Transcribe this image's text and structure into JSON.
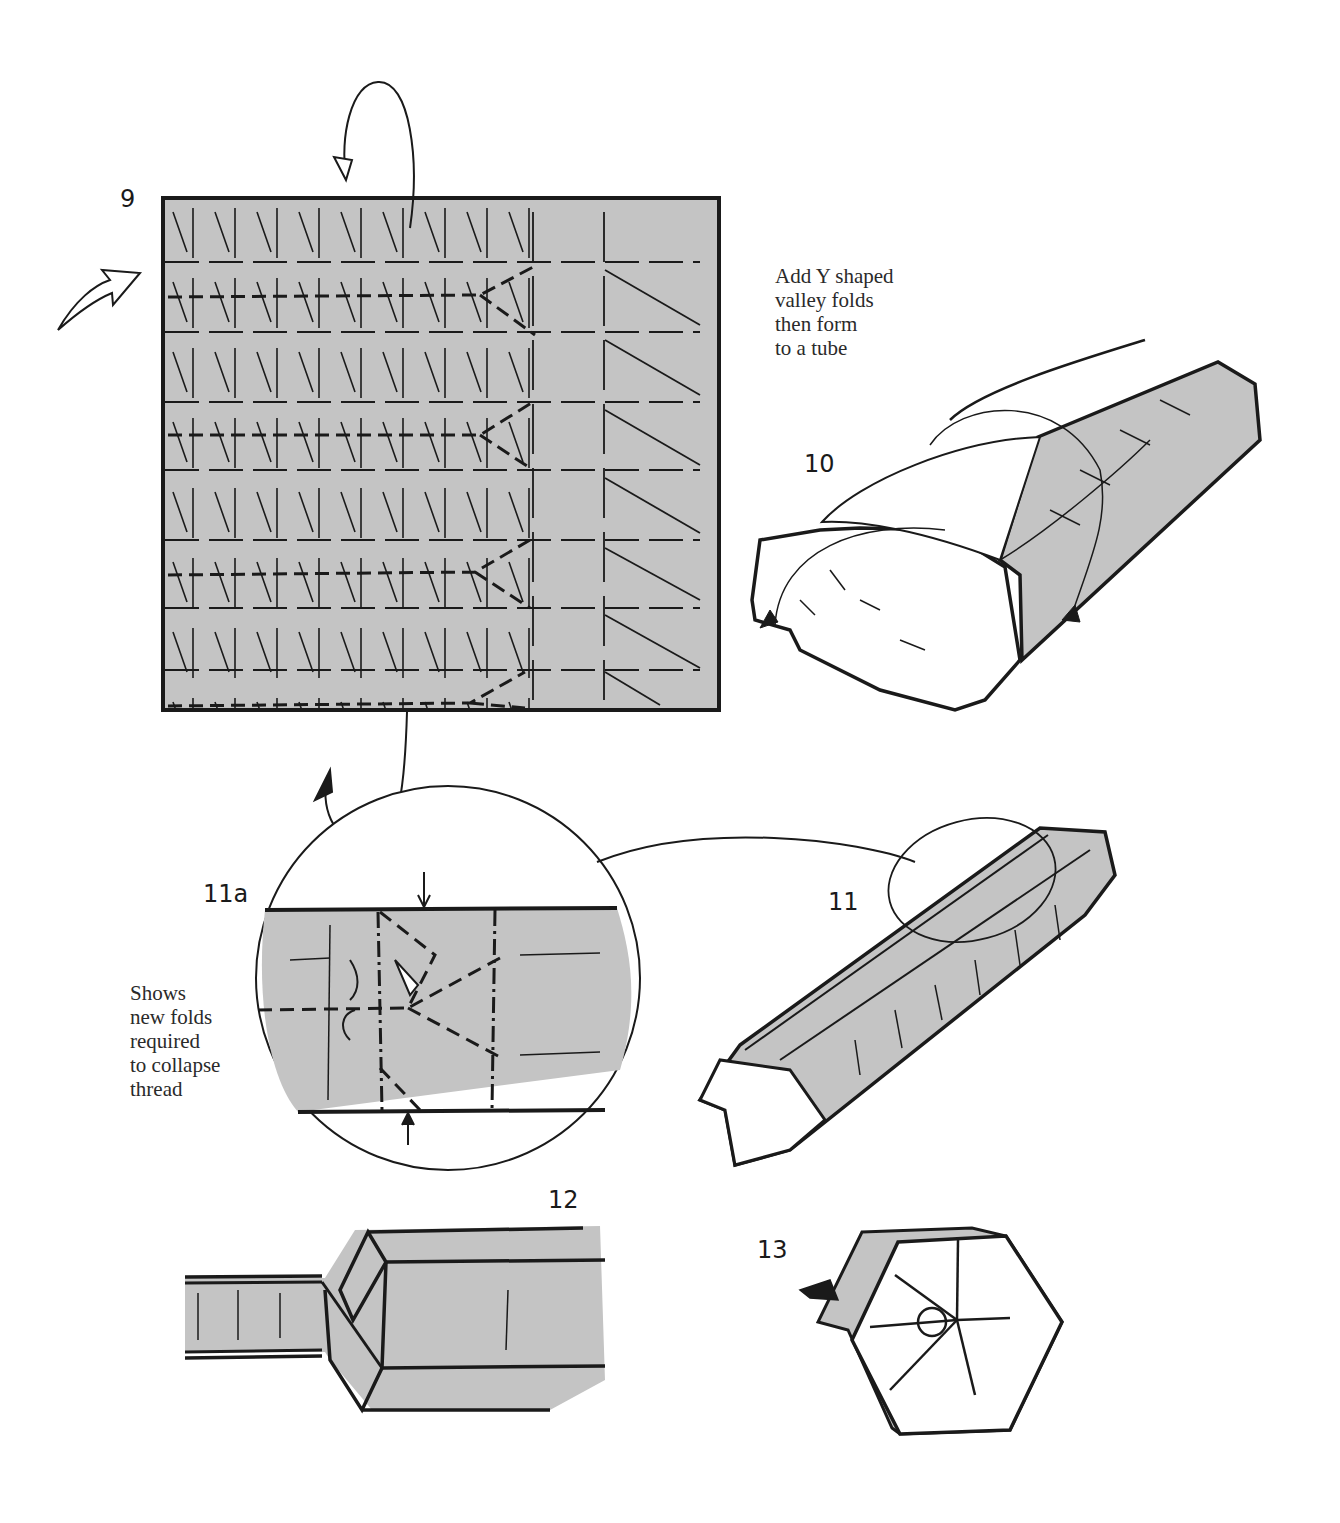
{
  "page": {
    "paper_fill": "#c4c4c4",
    "line_color": "#1a1a1a",
    "background": "#ffffff"
  },
  "steps": [
    {
      "id": "9",
      "label": "9",
      "description": "Square sheet with pleat grid; three-quarter shaded with Y-shaped valley folds on four rows"
    },
    {
      "id": "10",
      "label": "10",
      "description": "Sheet rolled into hexagonal tube"
    },
    {
      "id": "11a",
      "label": "11a",
      "description": "Circled close-up of thread collapse folds"
    },
    {
      "id": "11",
      "label": "11",
      "description": "Long hexagonal tube with flap, circled region"
    },
    {
      "id": "12",
      "label": "12",
      "description": "Side view of tube with collapsed narrow thread"
    },
    {
      "id": "13",
      "label": "13",
      "description": "End view: hexagonal face with radial creases"
    }
  ],
  "captions": {
    "step9_note": [
      "Add Y shaped",
      "valley folds",
      "then form",
      "to a tube"
    ],
    "step11a_note": [
      "Shows",
      "new folds",
      "required",
      "to collapse",
      "thread"
    ]
  },
  "icons": [
    "turn-over-arrow-icon",
    "rotate-arrow-icon",
    "fold-arrow-icon",
    "push-arrow-icon",
    "magnify-circle-icon"
  ]
}
